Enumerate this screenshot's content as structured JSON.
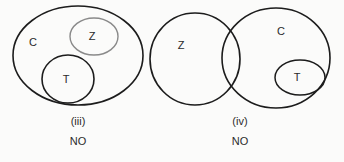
{
  "page": {
    "background_color": "#fbfbfa",
    "width": 344,
    "height": 162
  },
  "colors": {
    "stroke_dark": "#1c1c1c",
    "stroke_light": "#8a8a8a",
    "text": "#2a2a2a"
  },
  "diagrams": [
    {
      "id": "diagram-iii",
      "caption": "(iii)",
      "answer": "NO",
      "caption_center_x": 78,
      "caption_y": 122,
      "answer_y": 142,
      "sets": [
        {
          "name": "C",
          "shape": "ellipse",
          "label": "C",
          "cx": 78,
          "cy": 55.5,
          "rx": 65,
          "ry": 49.5,
          "stroke": "#1c1c1c",
          "stroke_width": 1.6,
          "label_x": 33,
          "label_y": 43
        },
        {
          "name": "Z",
          "shape": "ellipse",
          "label": "Z",
          "cx": 94,
          "cy": 36.5,
          "rx": 24,
          "ry": 18.5,
          "stroke": "#8a8a8a",
          "stroke_width": 1.4,
          "label_x": 92,
          "label_y": 37
        },
        {
          "name": "T",
          "shape": "ellipse",
          "label": "T",
          "cx": 68,
          "cy": 79,
          "rx": 26,
          "ry": 24,
          "stroke": "#1c1c1c",
          "stroke_width": 1.6,
          "label_x": 66,
          "label_y": 80
        }
      ]
    },
    {
      "id": "diagram-iv",
      "caption": "(iv)",
      "answer": "NO",
      "caption_center_x": 240,
      "caption_y": 122,
      "answer_y": 142,
      "sets": [
        {
          "name": "Z",
          "shape": "ellipse",
          "label": "Z",
          "cx": 195,
          "cy": 59,
          "rx": 45,
          "ry": 46,
          "stroke": "#1c1c1c",
          "stroke_width": 1.6,
          "label_x": 181,
          "label_y": 46
        },
        {
          "name": "C",
          "shape": "ellipse",
          "label": "C",
          "cx": 276,
          "cy": 58,
          "rx": 54,
          "ry": 50,
          "stroke": "#1c1c1c",
          "stroke_width": 1.6,
          "label_x": 281,
          "label_y": 32
        },
        {
          "name": "T",
          "shape": "ellipse",
          "label": "T",
          "cx": 300,
          "cy": 77.5,
          "rx": 25,
          "ry": 17.5,
          "stroke": "#1c1c1c",
          "stroke_width": 1.5,
          "label_x": 297,
          "label_y": 78
        }
      ]
    }
  ]
}
